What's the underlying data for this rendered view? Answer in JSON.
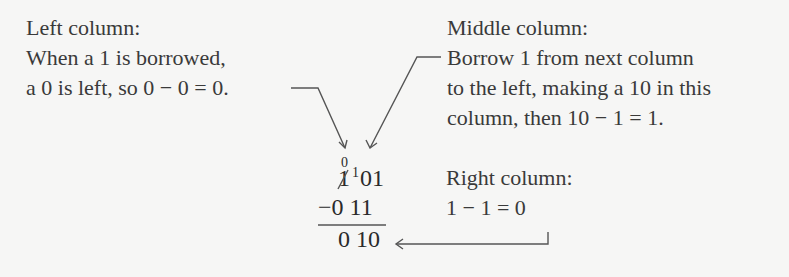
{
  "left_note": {
    "title": "Left column:",
    "line1": "When a 1 is borrowed,",
    "line2": "a 0 is left, so 0 − 0 = 0."
  },
  "middle_note": {
    "title": "Middle column:",
    "line1": "Borrow 1 from next column",
    "line2": "to the left, making a 10 in this",
    "line3": "column, then 10 − 1 = 1."
  },
  "right_note": {
    "title": "Right column:",
    "line1": "1 − 1 = 0"
  },
  "subtraction": {
    "borrow_mark_left": "0",
    "borrow_mark_middle": "1",
    "minuend_struck_digit": "1",
    "minuend_rest": "01",
    "subtrahend": "−0 11",
    "result": "0 10"
  },
  "colors": {
    "text": "#3a3a3a",
    "lines": "#555555",
    "background": "#f6f6f5"
  }
}
